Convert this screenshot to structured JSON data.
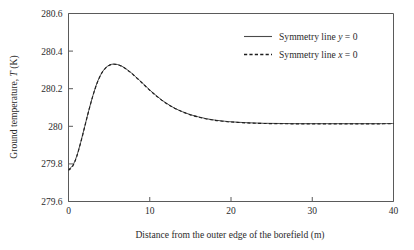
{
  "chart_data": {
    "type": "line",
    "title": "",
    "xlabel": "Distance from the outer edge of the borefield (m)",
    "ylabel_prefix": "Ground temperature, ",
    "ylabel_symbol": "T",
    "ylabel_suffix": " (K)",
    "ylabel_full": "Ground temperature, T (K)",
    "xlim": [
      0,
      40
    ],
    "ylim": [
      279.6,
      280.6
    ],
    "xticks": [
      "0",
      "10",
      "20",
      "30",
      "40"
    ],
    "xtick_values": [
      0,
      10,
      20,
      30,
      40
    ],
    "yticks": [
      "279.6",
      "279.8",
      "280",
      "280.2",
      "280.4",
      "280.6"
    ],
    "ytick_values": [
      279.6,
      279.8,
      280.0,
      280.2,
      280.4,
      280.6
    ],
    "grid": false,
    "legend_position": "top-right",
    "series": [
      {
        "name": "Symmetry line y = 0",
        "name_prefix": "Symmetry line ",
        "name_symbol": "y",
        "name_suffix": " = 0",
        "style": "solid",
        "color": "#4a4a4a",
        "x": [
          0,
          0.5,
          1,
          1.5,
          2,
          2.5,
          3,
          3.5,
          4,
          4.5,
          5,
          5.5,
          6,
          6.5,
          7,
          7.5,
          8,
          9,
          10,
          11,
          12,
          13,
          14,
          15,
          16,
          17,
          18,
          19,
          20,
          22,
          24,
          26,
          28,
          30,
          32,
          34,
          36,
          38,
          40
        ],
        "y": [
          279.772,
          279.79,
          279.84,
          279.915,
          280.0,
          280.085,
          280.163,
          280.229,
          280.277,
          280.308,
          280.325,
          280.331,
          280.329,
          280.321,
          280.308,
          280.292,
          280.274,
          280.234,
          280.193,
          280.156,
          280.124,
          280.098,
          280.078,
          280.062,
          280.05,
          280.04,
          280.033,
          280.028,
          280.024,
          280.019,
          280.016,
          280.015,
          280.014,
          280.014,
          280.014,
          280.014,
          280.014,
          280.014,
          280.015
        ]
      },
      {
        "name": "Symmetry line x = 0",
        "name_prefix": "Symmetry line ",
        "name_symbol": "x",
        "name_suffix": " = 0",
        "style": "dashed",
        "color": "#1e1e1e",
        "x": [
          0,
          0.5,
          1,
          1.5,
          2,
          2.5,
          3,
          3.5,
          4,
          4.5,
          5,
          5.5,
          6,
          6.5,
          7,
          7.5,
          8,
          9,
          10,
          11,
          12,
          13,
          14,
          15,
          16,
          17,
          18,
          19,
          20,
          22,
          24,
          26,
          28,
          30,
          32,
          34,
          36,
          38,
          40
        ],
        "y": [
          279.766,
          279.786,
          279.838,
          279.913,
          279.998,
          280.084,
          280.162,
          280.228,
          280.276,
          280.307,
          280.324,
          280.33,
          280.328,
          280.32,
          280.307,
          280.291,
          280.273,
          280.233,
          280.192,
          280.155,
          280.123,
          280.097,
          280.077,
          280.061,
          280.049,
          280.039,
          280.032,
          280.027,
          280.023,
          280.018,
          280.015,
          280.014,
          280.013,
          280.013,
          280.013,
          280.013,
          280.013,
          280.013,
          280.014
        ]
      }
    ],
    "annotations": {
      "peak_x": 5.5,
      "peak_y": 280.33,
      "start_y": 279.77,
      "plateau_y": 280.01
    }
  }
}
